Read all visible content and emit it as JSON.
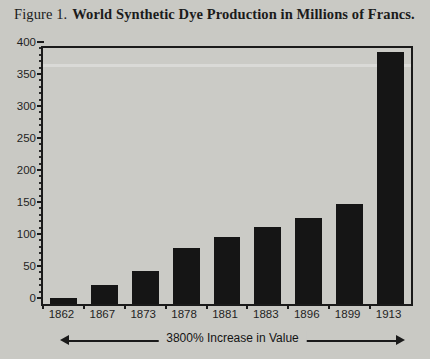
{
  "figure": {
    "label": "Figure 1.",
    "caption": "World Synthetic Dye Production in Millions of Francs."
  },
  "annotation": {
    "text": "3800% Increase in Value",
    "arrow_left": "arrow-left-icon",
    "arrow_right": "arrow-right-icon"
  },
  "chart_data": {
    "type": "bar",
    "title": "World Synthetic Dye Production in Millions of Francs.",
    "subtitle": "Figure 1.",
    "xlabel": "",
    "ylabel": "",
    "categories": [
      "1862",
      "1867",
      "1873",
      "1878",
      "1881",
      "1883",
      "1896",
      "1899",
      "1913"
    ],
    "values": [
      10,
      30,
      52,
      87,
      104,
      120,
      134,
      157,
      394
    ],
    "ylim": [
      0,
      400
    ],
    "yticks": [
      0,
      50,
      100,
      150,
      200,
      250,
      300,
      350,
      400
    ],
    "ytick_labels": [
      "0",
      "50",
      "100",
      "150",
      "200",
      "250",
      "300",
      "350",
      "400"
    ],
    "yminor_step": 10,
    "grid": false,
    "legend": null,
    "bar_color": "#151515",
    "plot_background": "#cbcbc6",
    "page_background": "#c9c9c4",
    "axis_color": "#1a1a1a",
    "annotations": [
      "3800% Increase in Value"
    ]
  }
}
